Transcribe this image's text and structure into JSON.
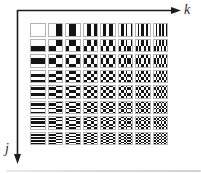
{
  "figure": {
    "x_axis_label": "k",
    "y_axis_label": "j"
  },
  "basis_grid": {
    "size": 8,
    "walsh_sequences": [
      [
        1,
        1,
        1,
        1,
        1,
        1,
        1,
        1
      ],
      [
        1,
        1,
        1,
        1,
        -1,
        -1,
        -1,
        -1
      ],
      [
        1,
        1,
        -1,
        -1,
        -1,
        -1,
        1,
        1
      ],
      [
        1,
        1,
        -1,
        -1,
        1,
        1,
        -1,
        -1
      ],
      [
        1,
        -1,
        -1,
        1,
        1,
        -1,
        -1,
        1
      ],
      [
        1,
        -1,
        -1,
        1,
        -1,
        1,
        1,
        -1
      ],
      [
        1,
        -1,
        1,
        -1,
        -1,
        1,
        -1,
        1
      ],
      [
        1,
        -1,
        1,
        -1,
        1,
        -1,
        1,
        -1
      ]
    ],
    "positive_color": "#ffffff",
    "negative_color": "#141414",
    "tile_border_color": "#b4b4b4"
  },
  "colors": {
    "background": "#ffffff",
    "axis": "#1c1c1c",
    "label": "#2a2a2a"
  }
}
